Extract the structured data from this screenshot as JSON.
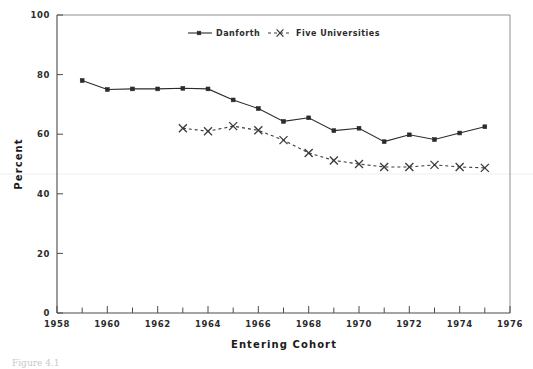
{
  "figure": {
    "caption": "Figure 4.1"
  },
  "chart_data": {
    "type": "line",
    "title": "",
    "xlabel": "Entering Cohort",
    "ylabel": "Percent",
    "xlim": [
      1958,
      1976
    ],
    "ylim": [
      0,
      100
    ],
    "xticks": [
      1958,
      1960,
      1962,
      1964,
      1966,
      1968,
      1970,
      1972,
      1974,
      1976
    ],
    "xtick_labels": [
      "1958",
      "1960",
      "1962",
      "1964",
      "1966",
      "1968",
      "1970",
      "1972",
      "1974",
      "1976"
    ],
    "x_minor_ticks": [
      1959,
      1961,
      1963,
      1965,
      1967,
      1969,
      1971,
      1973,
      1975
    ],
    "yticks": [
      0,
      20,
      40,
      60,
      80,
      100
    ],
    "ytick_labels": [
      "0",
      "20",
      "40",
      "60",
      "80",
      "100"
    ],
    "grid": false,
    "legend_position": "top-center",
    "series": [
      {
        "name": "Danforth",
        "marker": "square",
        "linestyle": "solid",
        "color": "#2b2b2b",
        "x": [
          1959,
          1960,
          1961,
          1962,
          1963,
          1964,
          1965,
          1966,
          1967,
          1968,
          1969,
          1970,
          1971,
          1972,
          1973,
          1974,
          1975
        ],
        "values": [
          78.0,
          75.0,
          75.2,
          75.2,
          75.4,
          75.2,
          71.5,
          68.6,
          64.3,
          65.5,
          61.2,
          62.0,
          57.5,
          59.8,
          58.2,
          60.4,
          62.5
        ]
      },
      {
        "name": "Five Universities",
        "marker": "x",
        "linestyle": "dashed",
        "color": "#3a3a3a",
        "x": [
          1963,
          1964,
          1965,
          1966,
          1967,
          1968,
          1969,
          1970,
          1971,
          1972,
          1973,
          1974,
          1975
        ],
        "values": [
          62.0,
          61.0,
          62.7,
          61.3,
          58.0,
          53.7,
          51.2,
          50.0,
          49.0,
          49.0,
          49.7,
          49.0,
          48.7
        ]
      }
    ]
  },
  "legend": {
    "entries": [
      {
        "label": "Danforth"
      },
      {
        "label": "Five Universities"
      }
    ]
  }
}
